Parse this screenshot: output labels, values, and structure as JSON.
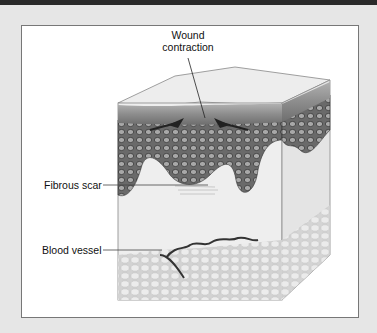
{
  "figure": {
    "labels": {
      "wound_line1": "Wound",
      "wound_line2": "contraction",
      "fibrous_scar": "Fibrous scar",
      "blood_vessel": "Blood vessel"
    },
    "colors": {
      "background": "#e6e6e6",
      "frame": "#ffffff",
      "epidermis": "#8a8a8a",
      "dermis": "#6e6e6e",
      "fat": "#dcdcdc"
    }
  }
}
